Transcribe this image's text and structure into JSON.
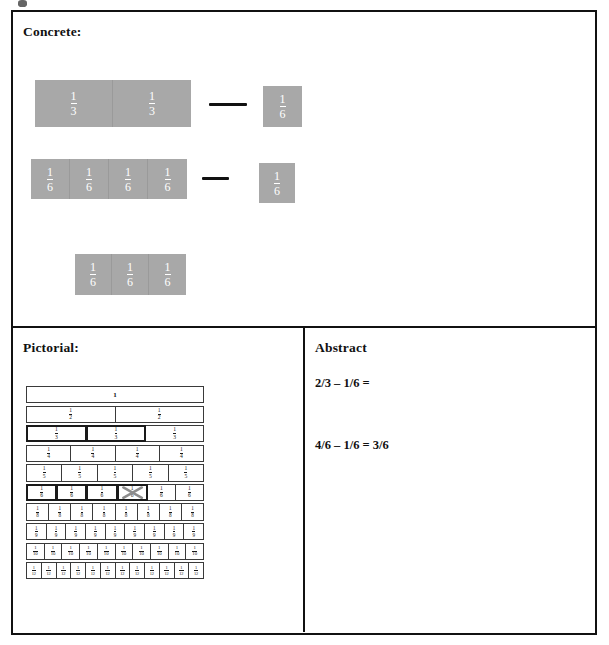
{
  "document": {
    "title": "Concrete-Pictorial-Abstract fraction subtraction worksheet"
  },
  "panels": {
    "concrete": {
      "heading": "Concrete:",
      "rows": [
        {
          "name": "minuend-two-thirds",
          "left_group": [
            {
              "label_num": "1",
              "label_den": "3"
            },
            {
              "label_num": "1",
              "label_den": "3"
            }
          ],
          "operator": "—",
          "right_group": [
            {
              "label_num": "1",
              "label_den": "6"
            }
          ]
        },
        {
          "name": "minuend-four-sixths",
          "left_group": [
            {
              "label_num": "1",
              "label_den": "6"
            },
            {
              "label_num": "1",
              "label_den": "6"
            },
            {
              "label_num": "1",
              "label_den": "6"
            },
            {
              "label_num": "1",
              "label_den": "6"
            }
          ],
          "operator": "—",
          "right_group": [
            {
              "label_num": "1",
              "label_den": "6"
            }
          ]
        },
        {
          "name": "answer-three-sixths",
          "left_group": [
            {
              "label_num": "1",
              "label_den": "6"
            },
            {
              "label_num": "1",
              "label_den": "6"
            },
            {
              "label_num": "1",
              "label_den": "6"
            }
          ],
          "operator": "",
          "right_group": []
        }
      ]
    },
    "pictorial": {
      "heading": "Pictorial:",
      "wall": {
        "rows": [
          {
            "name": "whole",
            "cells": 1,
            "label_num": "1",
            "label_den": "",
            "whole_label": "1",
            "bold_cells": [],
            "crossed_cells": []
          },
          {
            "name": "halves",
            "cells": 2,
            "label_num": "1",
            "label_den": "2",
            "whole_label": "",
            "bold_cells": [],
            "crossed_cells": []
          },
          {
            "name": "thirds",
            "cells": 3,
            "label_num": "1",
            "label_den": "3",
            "whole_label": "",
            "bold_cells": [
              0,
              1
            ],
            "crossed_cells": []
          },
          {
            "name": "fourths",
            "cells": 4,
            "label_num": "1",
            "label_den": "4",
            "whole_label": "",
            "bold_cells": [],
            "crossed_cells": []
          },
          {
            "name": "fifths",
            "cells": 5,
            "label_num": "1",
            "label_den": "5",
            "whole_label": "",
            "bold_cells": [],
            "crossed_cells": []
          },
          {
            "name": "sixths",
            "cells": 6,
            "label_num": "1",
            "label_den": "6",
            "whole_label": "",
            "bold_cells": [
              0,
              1,
              2,
              3
            ],
            "crossed_cells": [
              3
            ]
          },
          {
            "name": "eighths",
            "cells": 8,
            "label_num": "1",
            "label_den": "8",
            "whole_label": "",
            "bold_cells": [],
            "crossed_cells": []
          },
          {
            "name": "ninths",
            "cells": 9,
            "label_num": "1",
            "label_den": "9",
            "whole_label": "",
            "bold_cells": [],
            "crossed_cells": []
          },
          {
            "name": "tenths",
            "cells": 10,
            "label_num": "1",
            "label_den": "10",
            "whole_label": "",
            "bold_cells": [],
            "crossed_cells": []
          },
          {
            "name": "twelfths",
            "cells": 12,
            "label_num": "1",
            "label_den": "12",
            "whole_label": "",
            "bold_cells": [],
            "crossed_cells": []
          }
        ]
      }
    },
    "abstract": {
      "heading": "Abstract",
      "line_1": "2/3 – 1/6 =",
      "line_2": "4/6 – 1/6 = 3/6"
    }
  },
  "colors": {
    "tile_fill": "#a8a8a8",
    "tile_text": "#ffffff",
    "frame_stroke": "#111111",
    "wall_stroke": "#3a3a3a",
    "cross_out": "#8c8c8c",
    "page_background": "#ffffff"
  }
}
